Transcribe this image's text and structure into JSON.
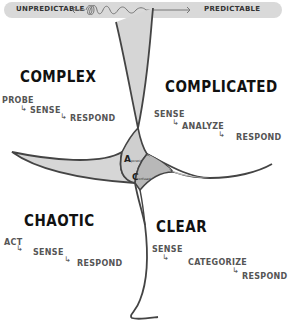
{
  "scale_bar": {
    "left_label": "UNPREDICTABLE",
    "right_label": "PREDICTABLE"
  },
  "domains": {
    "complex": {
      "title": "COMPLEX",
      "steps": [
        "PROBE",
        "SENSE",
        "RESPOND"
      ]
    },
    "complicated": {
      "title": "COMPLICATED",
      "steps": [
        "SENSE",
        "ANALYZE",
        "RESPOND"
      ]
    },
    "chaotic": {
      "title": "CHAOTIC",
      "steps": [
        "ACT",
        "SENSE",
        "RESPOND"
      ]
    },
    "clear": {
      "title": "CLEAR",
      "steps": [
        "SENSE",
        "CATEGORIZE",
        "RESPOND"
      ]
    }
  },
  "center": {
    "aporetic_initial": "A",
    "aporetic_rest": "poretic",
    "confused_initial": "C",
    "confused_rest": "onfused"
  },
  "colors": {
    "line": "#444444",
    "fill_light": "#d6d6d6",
    "fill_dark": "#b8b8b8",
    "bar": "#d9d9d9"
  }
}
